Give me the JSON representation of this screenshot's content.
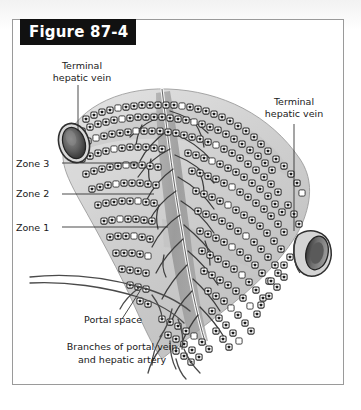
{
  "figure": {
    "banner_label": "Figure 87-4",
    "frame_color": "#9a9a9a",
    "banner_color": "#111111",
    "banner_text_color": "#ffffff",
    "page_background": "#ffffff"
  },
  "annotations": {
    "terminal_hepatic_vein_left": "Terminal\nhepatic vein",
    "terminal_hepatic_vein_right": "Terminal\nhepatic vein",
    "zone_3": "Zone 3",
    "zone_2": "Zone 2",
    "zone_1": "Zone 1",
    "portal_space": "Portal space",
    "branches": "Branches of portal vein\nand hepatic artery"
  },
  "illustration": {
    "subject": "liver-acinus-histology-diagram",
    "ink_color": "#3a3a3a",
    "tissue_fill": "#d9d9d9",
    "tissue_shadow": "#b4b4b4",
    "vessel_dark": "#4b4b4b",
    "cell_fill": "#ffffff",
    "nucleus_color": "#1c1c1c",
    "structures": [
      "terminal hepatic vein (left, elliptical lumen)",
      "terminal hepatic vein (right, cylindrical lumen)",
      "hepatocyte cords radiating between veins",
      "central portal tract with branching vessels",
      "portal space",
      "branches of portal vein and hepatic artery"
    ]
  }
}
